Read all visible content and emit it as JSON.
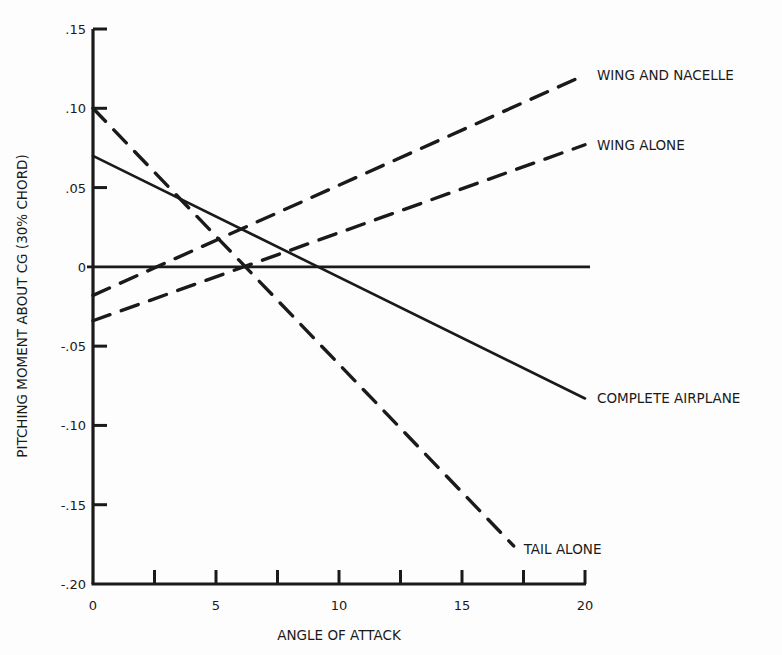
{
  "chart_data": {
    "type": "line",
    "title": "",
    "xlabel": "ANGLE OF ATTACK",
    "ylabel": "PITCHING MOMENT ABOUT CG (30% CHORD)",
    "xlim": [
      0,
      20
    ],
    "ylim": [
      -0.2,
      0.15
    ],
    "grid": false,
    "legend_position": "inline-right",
    "x_ticks": [
      0,
      2.5,
      5,
      7.5,
      10,
      12.5,
      15,
      17.5,
      20
    ],
    "x_tick_labels": [
      {
        "value": 0,
        "label": "0"
      },
      {
        "value": 5,
        "label": "5"
      },
      {
        "value": 10,
        "label": "10"
      },
      {
        "value": 15,
        "label": "15"
      },
      {
        "value": 20,
        "label": "20"
      }
    ],
    "y_ticks": [
      {
        "value": 0.15,
        "label": ".15"
      },
      {
        "value": 0.1,
        "label": ".10"
      },
      {
        "value": 0.05,
        "label": ".05"
      },
      {
        "value": 0.0,
        "label": "0"
      },
      {
        "value": -0.05,
        "label": "-.05"
      },
      {
        "value": -0.1,
        "label": "-.10"
      },
      {
        "value": -0.15,
        "label": "-.15"
      },
      {
        "value": -0.2,
        "label": "-.20"
      }
    ],
    "zero_line": true,
    "series": [
      {
        "name": "WING AND NACELLE",
        "style": "dashed",
        "x": [
          0,
          20
        ],
        "y": [
          -0.018,
          0.121
        ]
      },
      {
        "name": "WING ALONE",
        "style": "dashed",
        "x": [
          0,
          20
        ],
        "y": [
          -0.034,
          0.077
        ]
      },
      {
        "name": "COMPLETE AIRPLANE",
        "style": "solid",
        "x": [
          0,
          20
        ],
        "y": [
          0.07,
          -0.083
        ]
      },
      {
        "name": "TAIL ALONE",
        "style": "dashed",
        "x": [
          0,
          17.1
        ],
        "y": [
          0.1,
          -0.176
        ]
      }
    ]
  },
  "colors": {
    "ink": "#1a1a1a",
    "background": "#fdfdfd"
  }
}
